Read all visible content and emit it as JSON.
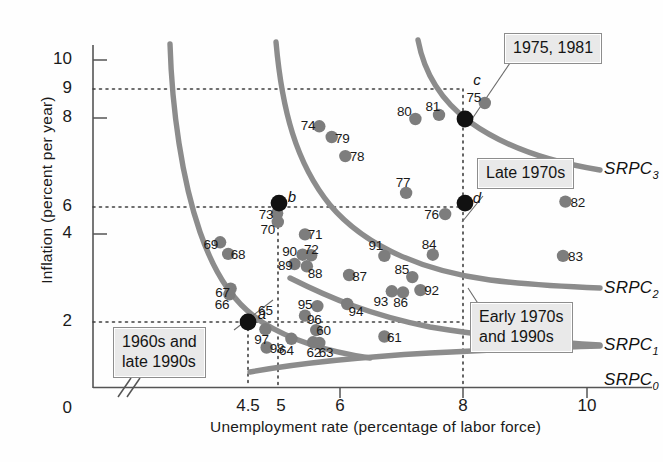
{
  "chart_data": {
    "type": "scatter",
    "title": "",
    "xlabel": "Unemployment rate (percentage of labor force)",
    "ylabel": "Inflation (percent per year)",
    "xlim": [
      4.0,
      10.4
    ],
    "ylim": [
      0.0,
      10.8
    ],
    "xticks": [
      "4.5",
      "5",
      "6",
      "8",
      "10"
    ],
    "xtick_values": [
      4.5,
      5,
      6,
      8,
      10
    ],
    "yticks": [
      "2",
      "4",
      "6",
      "8",
      "9",
      "10"
    ],
    "ytick_values": [
      2,
      4,
      6,
      8,
      9,
      10
    ],
    "origin_label": "0",
    "axis_break": true,
    "grid": "dotted-reference-lines",
    "gridlines_h": [
      2,
      6,
      9
    ],
    "gridlines_v": [
      4.5,
      5,
      8
    ],
    "legend_position": "inline-curve-labels",
    "equilibrium_points": [
      {
        "label": "a",
        "x": 4.5,
        "y": 2.0
      },
      {
        "label": "b",
        "x": 5.0,
        "y": 6.1
      },
      {
        "label": "c",
        "x": 8.0,
        "y": 9.0
      },
      {
        "label": "d",
        "x": 8.0,
        "y": 6.1
      }
    ],
    "curves": [
      {
        "name": "SRPC_0",
        "label": "SRPC",
        "sub": "0"
      },
      {
        "name": "SRPC_1",
        "label": "SRPC",
        "sub": "1"
      },
      {
        "name": "SRPC_2",
        "label": "SRPC",
        "sub": "2"
      },
      {
        "name": "SRPC_3",
        "label": "SRPC",
        "sub": "3"
      }
    ],
    "points": [
      {
        "year": "61",
        "x": 6.7,
        "y": 1.5,
        "lx": 6.86,
        "ly": 1.5
      },
      {
        "year": "62",
        "x": 5.55,
        "y": 1.3,
        "lx": 5.56,
        "ly": 0.95
      },
      {
        "year": "63",
        "x": 5.65,
        "y": 1.28,
        "lx": 5.76,
        "ly": 0.95
      },
      {
        "year": "64",
        "x": 5.2,
        "y": 1.42,
        "lx": 5.12,
        "ly": 1.02
      },
      {
        "year": "65",
        "x": 4.5,
        "y": 2.0,
        "lx": 4.78,
        "ly": 2.4
      },
      {
        "year": "66",
        "x": 4.2,
        "y": 2.95,
        "lx": 4.08,
        "ly": 2.62
      },
      {
        "year": "67",
        "x": 4.22,
        "y": 3.15,
        "lx": 4.09,
        "ly": 3.02
      },
      {
        "year": "68",
        "x": 4.18,
        "y": 4.35,
        "lx": 4.34,
        "ly": 4.35
      },
      {
        "year": "69",
        "x": 4.05,
        "y": 4.75,
        "lx": 3.9,
        "ly": 4.7
      },
      {
        "year": "70",
        "x": 4.98,
        "y": 5.45,
        "lx": 4.82,
        "ly": 5.22
      },
      {
        "year": "71",
        "x": 5.42,
        "y": 5.02,
        "lx": 5.58,
        "ly": 5.02
      },
      {
        "year": "72",
        "x": 5.38,
        "y": 4.32,
        "lx": 5.52,
        "ly": 4.52
      },
      {
        "year": "73",
        "x": 4.97,
        "y": 5.75,
        "lx": 4.79,
        "ly": 5.74
      },
      {
        "year": "74",
        "x": 5.65,
        "y": 8.75,
        "lx": 5.47,
        "ly": 8.78
      },
      {
        "year": "75",
        "x": 8.32,
        "y": 9.55,
        "lx": 8.14,
        "ly": 9.75
      },
      {
        "year": "76",
        "x": 7.68,
        "y": 5.72,
        "lx": 7.46,
        "ly": 5.73
      },
      {
        "year": "77",
        "x": 7.05,
        "y": 6.45,
        "lx": 7.0,
        "ly": 6.82
      },
      {
        "year": "78",
        "x": 6.07,
        "y": 7.72,
        "lx": 6.26,
        "ly": 7.73
      },
      {
        "year": "79",
        "x": 5.85,
        "y": 8.38,
        "lx": 6.02,
        "ly": 8.33
      },
      {
        "year": "80",
        "x": 7.2,
        "y": 9.0,
        "lx": 7.02,
        "ly": 9.28
      },
      {
        "year": "81",
        "x": 7.58,
        "y": 9.14,
        "lx": 7.48,
        "ly": 9.46
      },
      {
        "year": "82",
        "x": 9.62,
        "y": 6.15,
        "lx": 9.82,
        "ly": 6.15
      },
      {
        "year": "83",
        "x": 9.58,
        "y": 4.28,
        "lx": 9.78,
        "ly": 4.28
      },
      {
        "year": "84",
        "x": 7.48,
        "y": 4.32,
        "lx": 7.42,
        "ly": 4.7
      },
      {
        "year": "85",
        "x": 7.15,
        "y": 3.55,
        "lx": 6.98,
        "ly": 3.82
      },
      {
        "year": "86",
        "x": 7.0,
        "y": 3.02,
        "lx": 6.96,
        "ly": 2.7
      },
      {
        "year": "87",
        "x": 6.13,
        "y": 3.62,
        "lx": 6.3,
        "ly": 3.58
      },
      {
        "year": "88",
        "x": 5.45,
        "y": 3.92,
        "lx": 5.58,
        "ly": 3.7
      },
      {
        "year": "89",
        "x": 5.25,
        "y": 4.0,
        "lx": 5.1,
        "ly": 3.98
      },
      {
        "year": "90",
        "x": 5.52,
        "y": 4.3,
        "lx": 5.17,
        "ly": 4.46
      },
      {
        "year": "91",
        "x": 6.7,
        "y": 4.28,
        "lx": 6.56,
        "ly": 4.66
      },
      {
        "year": "92",
        "x": 7.28,
        "y": 3.1,
        "lx": 7.46,
        "ly": 3.1
      },
      {
        "year": "93",
        "x": 6.82,
        "y": 3.06,
        "lx": 6.64,
        "ly": 2.72
      },
      {
        "year": "94",
        "x": 6.1,
        "y": 2.62,
        "lx": 6.24,
        "ly": 2.38
      },
      {
        "year": "95",
        "x": 5.62,
        "y": 2.55,
        "lx": 5.42,
        "ly": 2.62
      },
      {
        "year": "96",
        "x": 5.42,
        "y": 2.22,
        "lx": 5.57,
        "ly": 2.1
      },
      {
        "year": "97",
        "x": 4.78,
        "y": 1.75,
        "lx": 4.72,
        "ly": 1.42
      },
      {
        "year": "98",
        "x": 4.8,
        "y": 1.12,
        "lx": 4.97,
        "ly": 1.1
      },
      {
        "year": "60",
        "x": 5.6,
        "y": 1.72,
        "lx": 5.72,
        "ly": 1.72
      }
    ],
    "annotations": [
      {
        "id": "callout-1960s",
        "text_line1": "1960s and",
        "text_line2": "late 1990s"
      },
      {
        "id": "callout-1975-1981",
        "text_line1": "1975, 1981",
        "text_line2": ""
      },
      {
        "id": "callout-late-1970s",
        "text_line1": "Late 1970s",
        "text_line2": ""
      },
      {
        "id": "callout-early-1970s-1990s",
        "text_line1": "Early 1970s",
        "text_line2": "and 1990s"
      }
    ],
    "colors": {
      "curve": "#8c8c8c",
      "point": "#7d7d7d",
      "equilibrium_point": "#111111",
      "axis": "#555555",
      "gridline": "#4d4d4d",
      "callout_bg": "#e9e9e9",
      "callout_border": "#8d8d8d",
      "text": "#1a1a1a"
    }
  },
  "axes": {
    "y_title": "Inflation (percent per year)",
    "x_title": "Unemployment rate (percentage of labor force)",
    "origin": "0",
    "y_ticks": [
      "10",
      "9",
      "8",
      "6",
      "4",
      "2"
    ],
    "x_ticks": [
      "4.5",
      "5",
      "6",
      "8",
      "10"
    ]
  },
  "curve_labels": [
    {
      "name": "srpc3",
      "base": "SRPC",
      "sub": "3"
    },
    {
      "name": "srpc2",
      "base": "SRPC",
      "sub": "2"
    },
    {
      "name": "srpc1",
      "base": "SRPC",
      "sub": "1"
    },
    {
      "name": "srpc0",
      "base": "SRPC",
      "sub": "0"
    }
  ],
  "equilibria": [
    {
      "name": "a",
      "label": "a"
    },
    {
      "name": "b",
      "label": "b"
    },
    {
      "name": "c",
      "label": "c"
    },
    {
      "name": "d",
      "label": "d"
    }
  ],
  "callouts": {
    "sixties": {
      "line1": "1960s and",
      "line2": "late 1990s"
    },
    "stagflation": {
      "line1": "1975, 1981"
    },
    "late70s": {
      "line1": "Late 1970s"
    },
    "early70s90s": {
      "line1": "Early 1970s",
      "line2": "and 1990s"
    }
  }
}
